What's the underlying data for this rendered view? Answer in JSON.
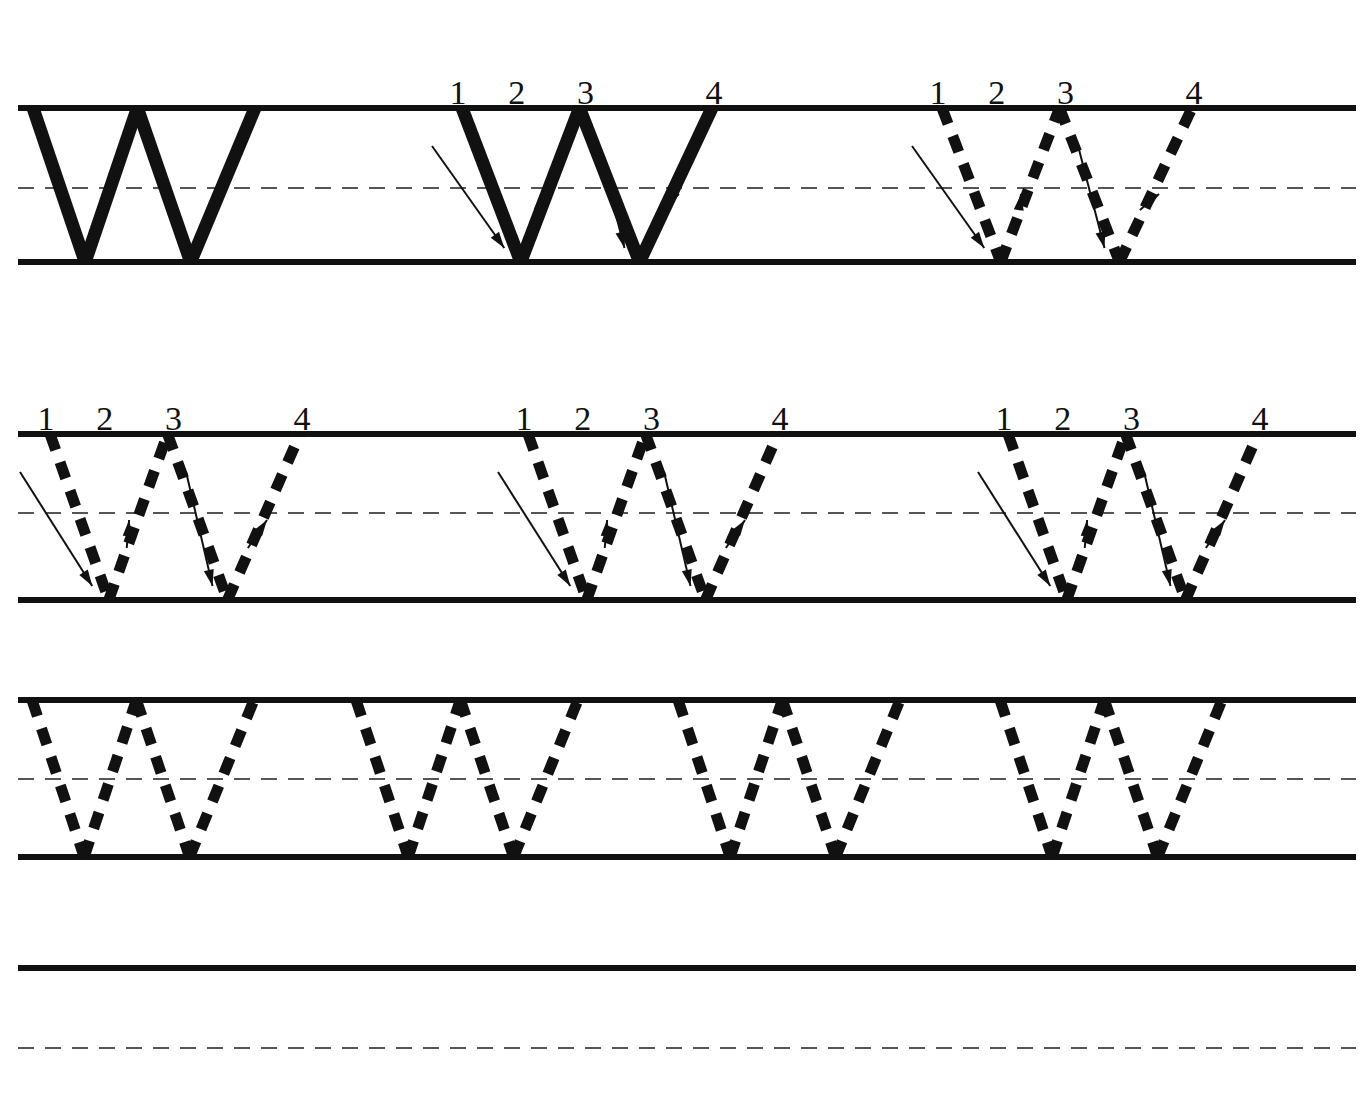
{
  "worksheet": {
    "title": "Letter W Handwriting Practice Worksheet",
    "letter": "W",
    "ink_color": "#111111",
    "guide_color": "#111111",
    "midline_color": "#555555",
    "page_background": "#ffffff",
    "page_width": 1370,
    "page_height": 1118
  },
  "stroke_labels": {
    "one": "1",
    "two": "2",
    "three": "3",
    "four": "4"
  },
  "geometry": {
    "rule_left": 18,
    "rule_right": 1356,
    "solid_line_width": 6,
    "midline_dash": "16 11",
    "midline_width": 2,
    "letter_dash": "17 13",
    "letter_stroke_width": 11,
    "solid_stroke_width": 13,
    "arrow_stroke_width": 2
  },
  "rows": [
    {
      "name": "row-1",
      "top_y": 108,
      "mid_y": 188,
      "base_y": 262,
      "letters": [
        {
          "name": "solid-model-w",
          "style": "solid",
          "x": 33,
          "width": 222,
          "numbered": false,
          "arrows": false
        },
        {
          "name": "numbered-solid-w",
          "style": "solid",
          "x": 462,
          "width": 250,
          "numbered": true,
          "arrows": true
        },
        {
          "name": "numbered-dashed-w",
          "style": "dashed",
          "x": 942,
          "width": 250,
          "numbered": true,
          "arrows": true
        }
      ]
    },
    {
      "name": "row-2",
      "top_y": 434,
      "mid_y": 513,
      "base_y": 600,
      "letters": [
        {
          "name": "numbered-dashed-w",
          "style": "dashed",
          "x": 50,
          "width": 250,
          "numbered": true,
          "arrows": true
        },
        {
          "name": "numbered-dashed-w",
          "style": "dashed",
          "x": 528,
          "width": 250,
          "numbered": true,
          "arrows": true
        },
        {
          "name": "numbered-dashed-w",
          "style": "dashed",
          "x": 1008,
          "width": 250,
          "numbered": true,
          "arrows": true
        }
      ]
    },
    {
      "name": "row-3",
      "top_y": 700,
      "mid_y": 779,
      "base_y": 857,
      "letters": [
        {
          "name": "trace-dashed-w",
          "style": "dashed",
          "x": 32,
          "width": 222,
          "numbered": false,
          "arrows": false
        },
        {
          "name": "trace-dashed-w",
          "style": "dashed",
          "x": 356,
          "width": 222,
          "numbered": false,
          "arrows": false
        },
        {
          "name": "trace-dashed-w",
          "style": "dashed",
          "x": 678,
          "width": 222,
          "numbered": false,
          "arrows": false
        },
        {
          "name": "trace-dashed-w",
          "style": "dashed",
          "x": 1000,
          "width": 222,
          "numbered": false,
          "arrows": false
        }
      ]
    },
    {
      "name": "row-4-blank",
      "top_y": 968,
      "mid_y": 1048,
      "base_y": null,
      "letters": []
    }
  ]
}
